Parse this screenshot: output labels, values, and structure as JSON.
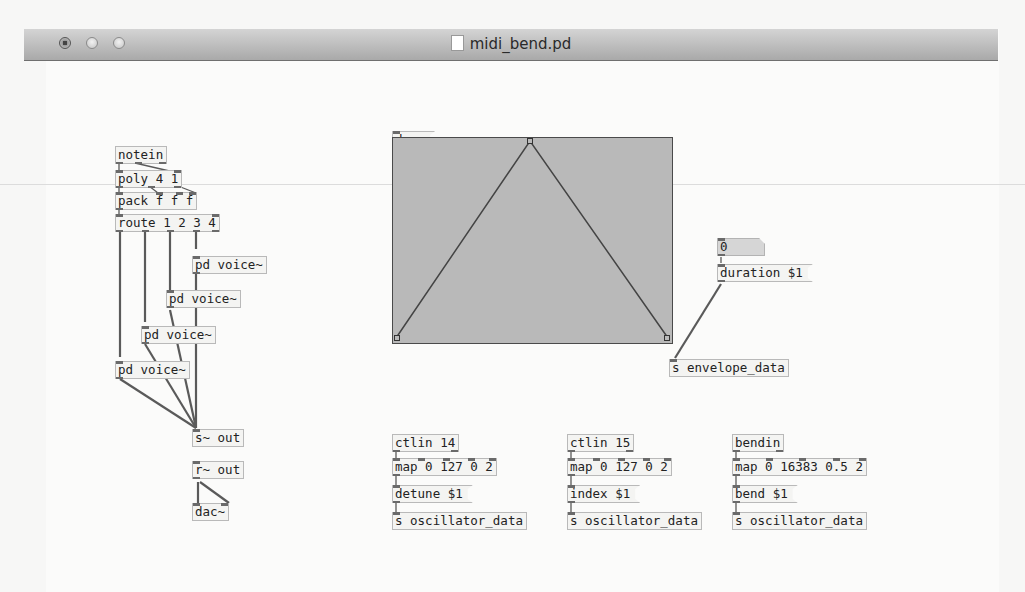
{
  "window": {
    "title": "midi_bend.pd",
    "buttons": [
      "close",
      "minimize",
      "zoom"
    ]
  },
  "patch": {
    "voice_chain": {
      "notein": "notein",
      "poly": "poly 4 1",
      "pack": "pack f f f",
      "route": "route 1 2 3 4",
      "voices": [
        "pd voice~",
        "pd voice~",
        "pd voice~",
        "pd voice~"
      ],
      "send_out": "s~ out",
      "receive_out": "r~ out",
      "dac": "dac~"
    },
    "envelope": {
      "dump_message": "dump",
      "graph": {
        "breakpoints": [
          [
            0,
            0
          ],
          [
            0.5,
            1
          ],
          [
            1,
            0
          ]
        ],
        "fill_color": "#b9b9b9"
      },
      "number_box_value": "0",
      "duration_message": "duration $1",
      "send": "s envelope_data"
    },
    "controllers": [
      {
        "ctlin": "ctlin 14",
        "map": "map 0 127 0 2",
        "message": "detune $1",
        "send": "s oscillator_data"
      },
      {
        "ctlin": "ctlin 15",
        "map": "map 0 127 0 2",
        "message": "index $1",
        "send": "s oscillator_data"
      },
      {
        "ctlin": "bendin",
        "map": "map 0 16383 0.5 2",
        "message": "bend $1",
        "send": "s oscillator_data"
      }
    ]
  }
}
